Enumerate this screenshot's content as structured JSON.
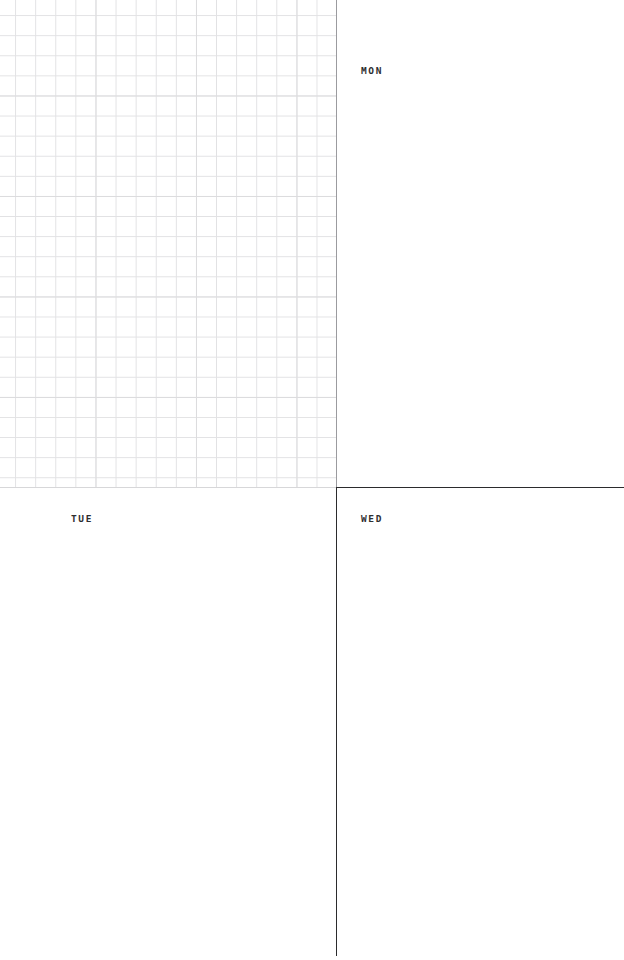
{
  "page": {
    "width": 624,
    "height": 960,
    "background_color": "#ffffff"
  },
  "colors": {
    "paper": "#ffffff",
    "grid_line": "#e2e2e4",
    "grid_line_major": "#dcdcde",
    "rule_dark": "#2b2b2d",
    "rule_light": "#d7d7d9",
    "rule_grid_edge": "#9b9b9f",
    "label_text": "#2e2e30"
  },
  "quadrants": [
    {
      "id": "top-left",
      "label": "",
      "content_type": "grid",
      "grid": {
        "cell_size_px": 20,
        "major_every": 5,
        "line_color": "#e2e2e4",
        "major_line_color": "#dcdcde"
      }
    },
    {
      "id": "top-right",
      "label": "MON",
      "content_type": "blank"
    },
    {
      "id": "bottom-left",
      "label": "TUE",
      "content_type": "blank"
    },
    {
      "id": "bottom-right",
      "label": "WED",
      "content_type": "blank"
    }
  ],
  "dividers": {
    "vertical_x": 336,
    "horizontal_y": 487
  }
}
